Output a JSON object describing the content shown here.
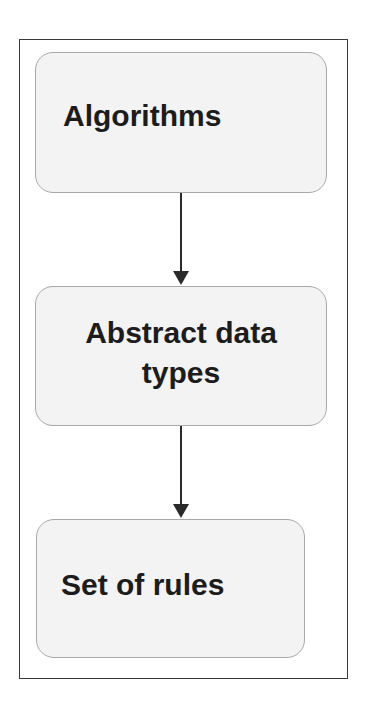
{
  "diagram": {
    "type": "flowchart",
    "direction": "top-to-bottom",
    "nodes": [
      {
        "id": "n1",
        "label": "Algorithms"
      },
      {
        "id": "n2",
        "label": "Abstract data types"
      },
      {
        "id": "n3",
        "label": "Set of rules"
      }
    ],
    "edges": [
      {
        "from": "n1",
        "to": "n2"
      },
      {
        "from": "n2",
        "to": "n3"
      }
    ],
    "colors": {
      "node_fill": "#f3f3f3",
      "node_border": "#a8a8a8",
      "text": "#1c1c1c",
      "arrow": "#2a2a2a",
      "frame": "#3a3a3a"
    }
  }
}
